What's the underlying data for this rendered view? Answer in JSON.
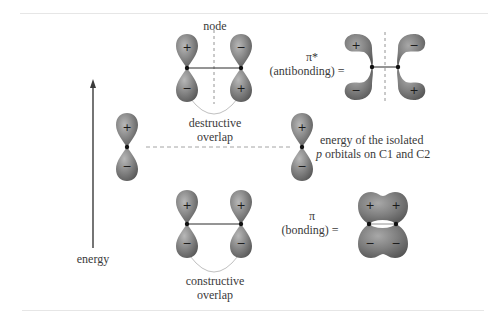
{
  "diagram": {
    "colors": {
      "lobe_fill": "#8a8a8a",
      "lobe_dark": "#5a5a5a",
      "lobe_highlight": "#b4b4b4",
      "line": "#2a2a2a",
      "guide": "#9a9a9a",
      "arc": "#bdbdbd",
      "text": "#3a3a3a",
      "rule": "#e6e6e6"
    },
    "energy_axis": {
      "label": "energy",
      "direction": "up"
    },
    "antibonding": {
      "node_label": "node",
      "overlap_label_line1": "destructive",
      "overlap_label_line2": "overlap",
      "symbol": "π*",
      "name": "(antibonding) =",
      "left_atom_signs": {
        "top": "+",
        "bottom": "−"
      },
      "right_atom_signs": {
        "top": "−",
        "bottom": "+"
      },
      "mo_signs": {
        "top_left": "+",
        "bottom_left": "−",
        "top_right": "−",
        "bottom_right": "+"
      }
    },
    "isolated": {
      "label_line1": "energy of the isolated",
      "label_line2_italic": "p",
      "label_line2_rest": " orbitals on C1 and C2",
      "left_signs": {
        "top": "+",
        "bottom": "−"
      },
      "right_signs": {
        "top": "+",
        "bottom": "−"
      }
    },
    "bonding": {
      "overlap_label_line1": "constructive",
      "overlap_label_line2": "overlap",
      "symbol": "π",
      "name": "(bonding) =",
      "left_atom_signs": {
        "top": "+",
        "bottom": "−"
      },
      "right_atom_signs": {
        "top": "+",
        "bottom": "−"
      },
      "mo_signs": {
        "top_left": "+",
        "top_right": "+",
        "bottom_left": "−",
        "bottom_right": "−"
      }
    }
  }
}
